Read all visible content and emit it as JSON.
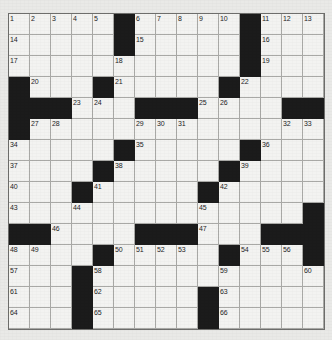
{
  "puzzle": {
    "title": "Crossword Grid",
    "rows": 15,
    "columns": 15,
    "cell_size_px": 21,
    "colors": {
      "block": "#1b1b1b",
      "cell": "#f3f3f1",
      "grid_line": "#a9a9a6",
      "page_background": "#e9e9e7",
      "number_text": "#1d1d1d"
    },
    "legend": {
      "block_symbol": "#",
      "open_symbol": "."
    },
    "grid_layout": [
      ".....#.....#...",
      ".....#.....#...",
      ".....#.....#...",
      "#...#.....#....",
      "###..#.###..##.",
      "#.....###....##",
      ".....#.....#...",
      "....#.....#....",
      "...#.....#.....",
      "..........#...#",
      "##.....###...###",
      "....#.....#...#",
      "...#.....#.....",
      "...#.....#.....",
      "...#.....#....."
    ],
    "numbered_cells": [
      {
        "number": 1,
        "row": 1,
        "col": 1
      },
      {
        "number": 2,
        "row": 1,
        "col": 2
      },
      {
        "number": 3,
        "row": 1,
        "col": 3
      },
      {
        "number": 4,
        "row": 1,
        "col": 4
      },
      {
        "number": 5,
        "row": 1,
        "col": 5
      },
      {
        "number": 6,
        "row": 1,
        "col": 7
      },
      {
        "number": 7,
        "row": 1,
        "col": 8
      },
      {
        "number": 8,
        "row": 1,
        "col": 9
      },
      {
        "number": 9,
        "row": 1,
        "col": 10
      },
      {
        "number": 10,
        "row": 1,
        "col": 11
      },
      {
        "number": 11,
        "row": 1,
        "col": 13
      },
      {
        "number": 12,
        "row": 1,
        "col": 14
      },
      {
        "number": 13,
        "row": 1,
        "col": 15
      },
      {
        "number": 14,
        "row": 2,
        "col": 1
      },
      {
        "number": 15,
        "row": 2,
        "col": 7
      },
      {
        "number": 16,
        "row": 2,
        "col": 13
      },
      {
        "number": 17,
        "row": 3,
        "col": 1
      },
      {
        "number": 18,
        "row": 3,
        "col": 6
      },
      {
        "number": 19,
        "row": 3,
        "col": 13
      },
      {
        "number": 20,
        "row": 4,
        "col": 2
      },
      {
        "number": 21,
        "row": 4,
        "col": 6
      },
      {
        "number": 22,
        "row": 4,
        "col": 12
      },
      {
        "number": 23,
        "row": 5,
        "col": 4
      },
      {
        "number": 24,
        "row": 5,
        "col": 5
      },
      {
        "number": 25,
        "row": 5,
        "col": 10
      },
      {
        "number": 26,
        "row": 5,
        "col": 11
      },
      {
        "number": 27,
        "row": 6,
        "col": 2
      },
      {
        "number": 28,
        "row": 6,
        "col": 3
      },
      {
        "number": 29,
        "row": 6,
        "col": 7
      },
      {
        "number": 30,
        "row": 6,
        "col": 8
      },
      {
        "number": 31,
        "row": 6,
        "col": 9
      },
      {
        "number": 32,
        "row": 6,
        "col": 14
      },
      {
        "number": 33,
        "row": 6,
        "col": 15
      },
      {
        "number": 34,
        "row": 7,
        "col": 1
      },
      {
        "number": 35,
        "row": 7,
        "col": 7
      },
      {
        "number": 36,
        "row": 7,
        "col": 13
      },
      {
        "number": 37,
        "row": 8,
        "col": 1
      },
      {
        "number": 38,
        "row": 8,
        "col": 6
      },
      {
        "number": 39,
        "row": 8,
        "col": 12
      },
      {
        "number": 40,
        "row": 9,
        "col": 1
      },
      {
        "number": 41,
        "row": 9,
        "col": 5
      },
      {
        "number": 42,
        "row": 9,
        "col": 11
      },
      {
        "number": 43,
        "row": 10,
        "col": 1
      },
      {
        "number": 44,
        "row": 10,
        "col": 4
      },
      {
        "number": 45,
        "row": 10,
        "col": 10
      },
      {
        "number": 46,
        "row": 11,
        "col": 3
      },
      {
        "number": 47,
        "row": 11,
        "col": 10
      },
      {
        "number": 48,
        "row": 12,
        "col": 1
      },
      {
        "number": 49,
        "row": 12,
        "col": 2
      },
      {
        "number": 50,
        "row": 12,
        "col": 6
      },
      {
        "number": 51,
        "row": 12,
        "col": 7
      },
      {
        "number": 52,
        "row": 12,
        "col": 8
      },
      {
        "number": 53,
        "row": 12,
        "col": 9
      },
      {
        "number": 54,
        "row": 12,
        "col": 12
      },
      {
        "number": 55,
        "row": 12,
        "col": 13
      },
      {
        "number": 56,
        "row": 12,
        "col": 14
      },
      {
        "number": 57,
        "row": 13,
        "col": 1
      },
      {
        "number": 58,
        "row": 13,
        "col": 5
      },
      {
        "number": 59,
        "row": 13,
        "col": 11
      },
      {
        "number": 60,
        "row": 13,
        "col": 15
      },
      {
        "number": 61,
        "row": 14,
        "col": 1
      },
      {
        "number": 62,
        "row": 14,
        "col": 5
      },
      {
        "number": 63,
        "row": 14,
        "col": 11
      },
      {
        "number": 64,
        "row": 15,
        "col": 1
      },
      {
        "number": 65,
        "row": 15,
        "col": 5
      },
      {
        "number": 66,
        "row": 15,
        "col": 11
      }
    ],
    "block_cells": [
      {
        "row": 1,
        "col": 6
      },
      {
        "row": 1,
        "col": 12
      },
      {
        "row": 2,
        "col": 6
      },
      {
        "row": 2,
        "col": 12
      },
      {
        "row": 3,
        "col": 12
      },
      {
        "row": 4,
        "col": 1
      },
      {
        "row": 4,
        "col": 5
      },
      {
        "row": 4,
        "col": 11
      },
      {
        "row": 5,
        "col": 1
      },
      {
        "row": 5,
        "col": 2
      },
      {
        "row": 5,
        "col": 3
      },
      {
        "row": 5,
        "col": 7
      },
      {
        "row": 5,
        "col": 8
      },
      {
        "row": 5,
        "col": 9
      },
      {
        "row": 5,
        "col": 14
      },
      {
        "row": 5,
        "col": 15
      },
      {
        "row": 6,
        "col": 1
      },
      {
        "row": 7,
        "col": 6
      },
      {
        "row": 7,
        "col": 12
      },
      {
        "row": 8,
        "col": 5
      },
      {
        "row": 8,
        "col": 11
      },
      {
        "row": 9,
        "col": 4
      },
      {
        "row": 9,
        "col": 10
      },
      {
        "row": 10,
        "col": 15
      },
      {
        "row": 11,
        "col": 1
      },
      {
        "row": 11,
        "col": 2
      },
      {
        "row": 11,
        "col": 7
      },
      {
        "row": 11,
        "col": 8
      },
      {
        "row": 11,
        "col": 9
      },
      {
        "row": 11,
        "col": 13
      },
      {
        "row": 11,
        "col": 14
      },
      {
        "row": 11,
        "col": 15
      },
      {
        "row": 12,
        "col": 5
      },
      {
        "row": 12,
        "col": 11
      },
      {
        "row": 12,
        "col": 15
      },
      {
        "row": 13,
        "col": 4
      },
      {
        "row": 14,
        "col": 4
      },
      {
        "row": 14,
        "col": 10
      },
      {
        "row": 15,
        "col": 4
      },
      {
        "row": 15,
        "col": 10
      }
    ],
    "entered_letters": []
  }
}
